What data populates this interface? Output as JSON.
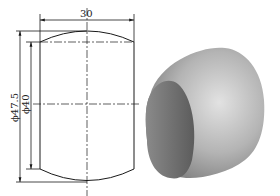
{
  "drawing": {
    "width_dimension": "30",
    "outer_diameter": "ϕ47.5",
    "inner_diameter": "ϕ40"
  },
  "colors": {
    "line": "#1a1a1a",
    "shade_dark": "#6b6b6b",
    "shade_light": "#d8d8d8"
  }
}
